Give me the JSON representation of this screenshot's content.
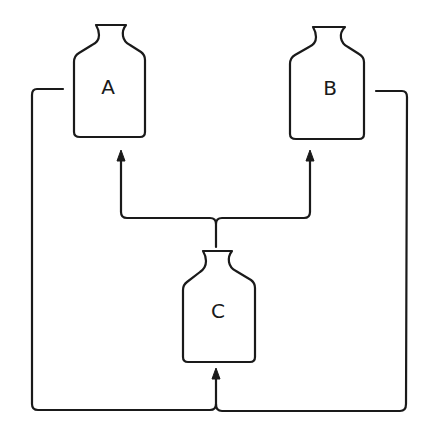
{
  "diagram": {
    "type": "flow-schematic",
    "line_color": "#1a1a1a",
    "background": "#ffffff",
    "bottles": [
      {
        "id": "A",
        "label": "A"
      },
      {
        "id": "B",
        "label": "B"
      },
      {
        "id": "C",
        "label": "C"
      }
    ],
    "connections": [
      {
        "from": "C",
        "to": "A",
        "arrow": "up"
      },
      {
        "from": "C",
        "to": "B",
        "arrow": "up"
      },
      {
        "from": "A",
        "to": "C",
        "via": "left-loop",
        "arrow": "up"
      },
      {
        "from": "B",
        "to": "C",
        "via": "right-loop",
        "arrow": "up"
      }
    ]
  }
}
